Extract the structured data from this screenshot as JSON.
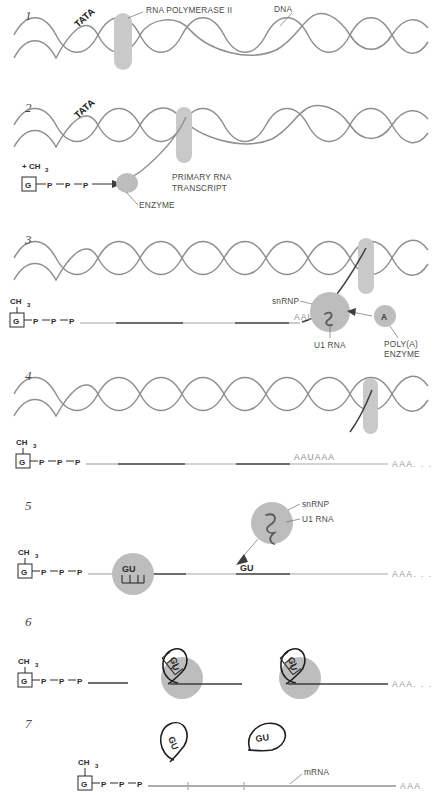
{
  "figure": {
    "colors": {
      "helix": "#8f8f8f",
      "capsule": "#c9c9c9",
      "blob": "#bdbdbd",
      "rna_dark": "#3d3d3d",
      "rna_light": "#a8a8a8",
      "text": "#3a3a3a",
      "sequence_text": "#8d8d8d"
    }
  },
  "panels": [
    {
      "number": "1",
      "labels": {
        "tata": "TATA",
        "polymerase": "RNA POLYMERASE II",
        "dna": "DNA"
      }
    },
    {
      "number": "2",
      "labels": {
        "tata": "TATA",
        "methyl": "+ CH",
        "methyl_sub": "3",
        "cap_g": "G",
        "cap_p1": "P",
        "cap_p2": "P",
        "cap_p3": "P",
        "transcript_line1": "PRIMARY RNA",
        "transcript_line2": "TRANSCRIPT",
        "enzyme": "ENZYME"
      }
    },
    {
      "number": "3",
      "labels": {
        "ch3": "CH",
        "ch3_sub": "3",
        "cap_g": "G",
        "cap_p1": "P",
        "cap_p2": "P",
        "cap_p3": "P",
        "snrnp": "snRNP",
        "u1rna": "U1 RNA",
        "aauaaa": "AAUAAA",
        "polya_a": "A",
        "polya_line1": "POLY(A)",
        "polya_line2": "ENZYME"
      }
    },
    {
      "number": "4",
      "labels": {
        "ch3": "CH",
        "ch3_sub": "3",
        "cap_g": "G",
        "cap_p1": "P",
        "cap_p2": "P",
        "cap_p3": "P",
        "aauaaa": "AAUAAA",
        "tail": "AAA. . ."
      }
    },
    {
      "number": "5",
      "labels": {
        "ch3": "CH",
        "ch3_sub": "3",
        "cap_g": "G",
        "cap_p1": "P",
        "cap_p2": "P",
        "cap_p3": "P",
        "snrnp": "snRNP",
        "u1rna": "U1 RNA",
        "gu_bound": "GU",
        "gu_free": "GU",
        "tail": "AAA. . ."
      }
    },
    {
      "number": "6",
      "labels": {
        "ch3": "CH",
        "ch3_sub": "3",
        "cap_g": "G",
        "cap_p1": "P",
        "cap_p2": "P",
        "cap_p3": "P",
        "gu_left": "GU",
        "gu_right": "GU",
        "tail": "AAA. . ."
      }
    },
    {
      "number": "7",
      "labels": {
        "ch3": "CH",
        "ch3_sub": "3",
        "cap_g": "G",
        "cap_p1": "P",
        "cap_p2": "P",
        "cap_p3": "P",
        "gu_left": "GU",
        "gu_right": "GU",
        "mrna": "mRNA",
        "tail": "AAA"
      }
    }
  ]
}
